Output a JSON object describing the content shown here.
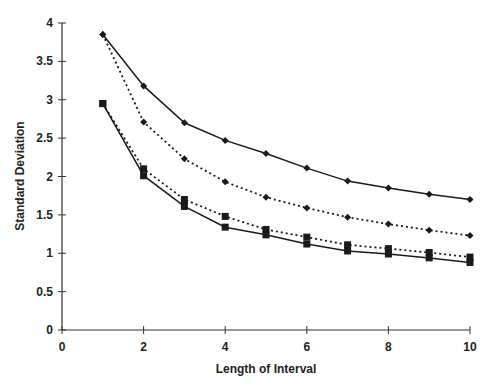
{
  "chart_data": {
    "type": "line",
    "title": "",
    "xlabel": "Length of Interval",
    "ylabel": "Standard Deviation",
    "xlim": [
      0,
      10
    ],
    "ylim": [
      0,
      4
    ],
    "xticks": [
      0,
      2,
      4,
      6,
      8,
      10
    ],
    "yticks": [
      0,
      0.5,
      1,
      1.5,
      2,
      2.5,
      3,
      3.5,
      4
    ],
    "ytick_labels": [
      "0",
      "0.5",
      "1",
      "1.5",
      "2",
      "2.5",
      "3",
      "3.5",
      "4"
    ],
    "grid": false,
    "legend": "none",
    "x": [
      1,
      2,
      3,
      4,
      5,
      6,
      7,
      8,
      9,
      10
    ],
    "series": [
      {
        "name": "diamond-solid",
        "marker": "diamond",
        "line": "solid",
        "values": [
          3.85,
          3.18,
          2.7,
          2.47,
          2.3,
          2.11,
          1.94,
          1.85,
          1.77,
          1.7
        ]
      },
      {
        "name": "diamond-dotted",
        "marker": "diamond",
        "line": "dotted",
        "values": [
          3.85,
          2.71,
          2.23,
          1.93,
          1.73,
          1.59,
          1.47,
          1.38,
          1.3,
          1.23
        ]
      },
      {
        "name": "square-dotted",
        "marker": "square",
        "line": "dotted",
        "values": [
          2.95,
          2.1,
          1.7,
          1.48,
          1.31,
          1.21,
          1.11,
          1.06,
          1.01,
          0.95
        ]
      },
      {
        "name": "square-solid",
        "marker": "square",
        "line": "solid",
        "values": [
          2.95,
          2.01,
          1.61,
          1.34,
          1.24,
          1.12,
          1.03,
          0.99,
          0.94,
          0.88
        ]
      }
    ]
  },
  "colors": {
    "line": "#1a1a1a",
    "axis": "#333333"
  }
}
